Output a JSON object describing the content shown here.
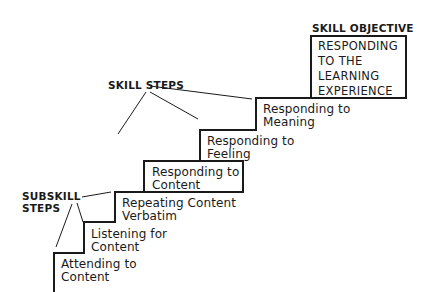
{
  "diagram": {
    "type": "staircase",
    "headings": {
      "skill_objective": "SKILL OBJECTIVE",
      "skill_steps": "SKILL STEPS",
      "subskill_steps": "SUBSKILL\nSTEPS"
    },
    "objective": "RESPONDING\nTO THE\nLEARNING\nEXPERIENCE",
    "steps": [
      {
        "label": "Attending to\nContent",
        "level": "subskill"
      },
      {
        "label": "Listening for\nContent",
        "level": "subskill"
      },
      {
        "label": "Repeating Content\nVerbatim",
        "level": "subskill"
      },
      {
        "label": "Responding to\nContent",
        "level": "skill"
      },
      {
        "label": "Responding to\nFeeling",
        "level": "skill"
      },
      {
        "label": "Responding to\nMeaning",
        "level": "skill"
      }
    ],
    "colors": {
      "line": "#1a1a1a",
      "background": "#ffffff"
    }
  }
}
